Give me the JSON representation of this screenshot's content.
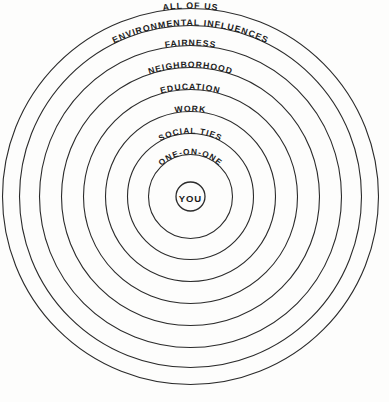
{
  "diagram": {
    "type": "concentric-rings",
    "background_color": "#fdfdfc",
    "stroke_color": "#2b2b2b",
    "text_color": "#1a1a1a",
    "center": {
      "x": 190.5,
      "y": 196.5
    },
    "center_label": "YOU",
    "rings": [
      {
        "id": "you",
        "label": "YOU",
        "radius": 14.5,
        "label_style": "horizontal"
      },
      {
        "id": "one-on-one",
        "label": "ONE-ON-ONE",
        "radius": 42,
        "label_style": "curved"
      },
      {
        "id": "social",
        "label": "SOCIAL TIES",
        "radius": 63,
        "label_style": "curved"
      },
      {
        "id": "work",
        "label": "WORK",
        "radius": 85,
        "label_style": "curved"
      },
      {
        "id": "education",
        "label": "EDUCATION",
        "radius": 107,
        "label_style": "curved"
      },
      {
        "id": "neighborhood",
        "label": "NEIGHBORHOOD",
        "radius": 129,
        "label_style": "curved"
      },
      {
        "id": "fairness",
        "label": "FAIRNESS",
        "radius": 151,
        "label_style": "curved"
      },
      {
        "id": "environment",
        "label": "ENVIRONMENTAL INFLUENCES",
        "radius": 171,
        "label_style": "curved"
      },
      {
        "id": "all-of-us",
        "label": "ALL OF US",
        "radius": 188,
        "label_style": "curved"
      }
    ]
  }
}
